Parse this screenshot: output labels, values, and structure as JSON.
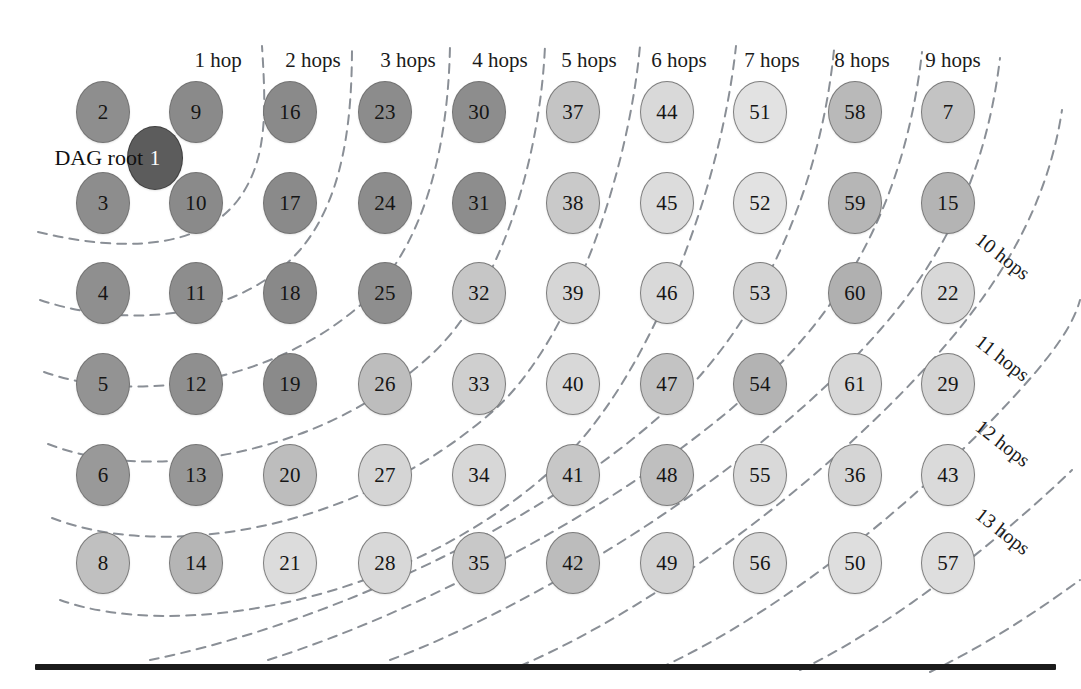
{
  "figure": {
    "type": "node-hop-distance-diagram",
    "root_caption": "DAG root",
    "background_color": "#ffffff",
    "rule_color": "#1b1b1b",
    "curve_color": "#8a8f96"
  },
  "column_hop_labels": [
    {
      "text": "1 hop",
      "x": 218,
      "y": 60
    },
    {
      "text": "2 hops",
      "x": 313,
      "y": 60
    },
    {
      "text": "3 hops",
      "x": 408,
      "y": 60
    },
    {
      "text": "4 hops",
      "x": 500,
      "y": 60
    },
    {
      "text": "5 hops",
      "x": 589,
      "y": 60
    },
    {
      "text": "6 hops",
      "x": 679,
      "y": 60
    },
    {
      "text": "7 hops",
      "x": 772,
      "y": 60
    },
    {
      "text": "8 hops",
      "x": 862,
      "y": 60
    },
    {
      "text": "9 hops",
      "x": 953,
      "y": 60
    }
  ],
  "diagonal_hop_labels": [
    {
      "text": "10 hops",
      "x": 985,
      "y": 228,
      "rotate": 38
    },
    {
      "text": "11 hops",
      "x": 985,
      "y": 330,
      "rotate": 38
    },
    {
      "text": "12 hops",
      "x": 985,
      "y": 415,
      "rotate": 38
    },
    {
      "text": "13 hops",
      "x": 985,
      "y": 503,
      "rotate": 38
    }
  ],
  "grid": {
    "column_x": [
      103,
      196,
      290,
      385,
      479,
      573,
      667,
      760,
      855,
      948
    ],
    "row_y": [
      112,
      203,
      293,
      384,
      475,
      563
    ],
    "rows": [
      [
        2,
        9,
        16,
        23,
        30,
        37,
        44,
        51,
        58,
        7
      ],
      [
        3,
        10,
        17,
        24,
        31,
        38,
        45,
        52,
        59,
        15
      ],
      [
        4,
        11,
        18,
        25,
        32,
        39,
        46,
        53,
        60,
        22
      ],
      [
        5,
        12,
        19,
        26,
        33,
        40,
        47,
        54,
        61,
        29
      ],
      [
        6,
        13,
        20,
        27,
        34,
        41,
        48,
        55,
        36,
        43
      ],
      [
        8,
        14,
        21,
        28,
        35,
        42,
        49,
        56,
        50,
        57
      ]
    ],
    "shade": [
      [
        "#8e8e8e",
        "#8a8a8a",
        "#8a8a8a",
        "#8c8c8c",
        "#8d8d8d",
        "#c4c4c4",
        "#d9d9d9",
        "#e2e2e2",
        "#b9b9b9",
        "#c3c3c3"
      ],
      [
        "#8d8d8d",
        "#8a8a8a",
        "#8a8a8a",
        "#8c8c8c",
        "#8d8d8d",
        "#c9c9c9",
        "#dcdcdc",
        "#e2e2e2",
        "#b6b6b6",
        "#b4b4b4"
      ],
      [
        "#8f8f8f",
        "#8d8d8d",
        "#898989",
        "#8e8e8e",
        "#c6c6c6",
        "#d6d6d6",
        "#d9d9d9",
        "#d4d4d4",
        "#b0b0b0",
        "#d8d8d8"
      ],
      [
        "#939393",
        "#8f8f8f",
        "#8a8a8a",
        "#bdbdbd",
        "#cfcfcf",
        "#d8d8d8",
        "#c3c3c3",
        "#b3b3b3",
        "#d7d7d7",
        "#d4d4d4"
      ],
      [
        "#999999",
        "#979797",
        "#bdbdbd",
        "#d5d5d5",
        "#d7d7d7",
        "#c7c7c7",
        "#bfbfbf",
        "#d9d9d9",
        "#d5d5d5",
        "#dadada"
      ],
      [
        "#c0c0c0",
        "#b5b5b5",
        "#dcdcdc",
        "#d8d8d8",
        "#c8c8c8",
        "#bcbcbc",
        "#d3d3d3",
        "#d8d8d8",
        "#dedede",
        "#dedede"
      ]
    ]
  },
  "root_node": {
    "label": 1,
    "x": 155,
    "y": 158,
    "color": "#5c5c5c",
    "text_color": "#ffffff",
    "caption_x": 143,
    "caption_y": 158
  },
  "bottom_rule": {
    "x": 35,
    "y": 664,
    "width": 1021,
    "height": 6
  },
  "hop_boundary_curves": [
    "M 38 232 C 120 252 200 250 238 200 C 268 160 266 110 262 46",
    "M 40 300 C 130 330 240 318 300 250 C 344 198 352 120 352 46",
    "M 44 372 C 140 406 280 380 366 300 C 424 244 448 150 450 46",
    "M 48 444 C 150 484 320 456 430 356 C 500 292 540 160 545 46",
    "M 52 518 C 160 560 352 534 492 412 C 570 344 628 176 640 46",
    "M 60 600 C 170 640 402 608 556 466 C 646 384 720 196 736 46",
    "M 150 660 C 300 630 520 540 660 416 C 760 328 820 190 834 50",
    "M 268 660 C 420 612 640 500 772 372 C 862 284 908 176 922 52",
    "M 390 660 C 540 604 760 468 880 330 C 952 248 988 160 1000 58",
    "M 520 666 C 660 606 840 470 950 340 C 1014 264 1050 190 1062 110",
    "M 660 668 C 790 608 930 490 1020 390 C 1058 348 1074 322 1080 300",
    "M 800 670 C 900 622 1010 530 1072 470",
    "M 930 672 C 1000 638 1052 600 1080 580"
  ]
}
